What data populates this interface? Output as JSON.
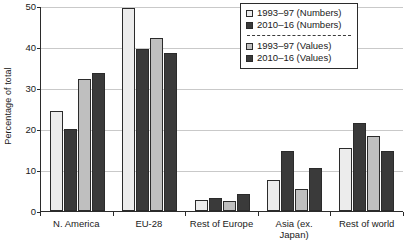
{
  "chart_data": {
    "type": "bar",
    "title": "",
    "subtitle": "",
    "xlabel": "",
    "ylabel": "Percentage of total",
    "ylim": [
      0,
      50
    ],
    "yticks": [
      0,
      10,
      20,
      30,
      40,
      50
    ],
    "ytick_labels": [
      "0",
      "10",
      "20",
      "30",
      "40",
      "50"
    ],
    "grid": true,
    "legend_position": "top-right",
    "legend_separator": "dashed",
    "categories": [
      "N. America",
      "EU-28",
      "Rest of Europe",
      "Asia (ex. Japan)",
      "Rest of world"
    ],
    "category_lines": [
      [
        "N. America"
      ],
      [
        "EU-28"
      ],
      [
        "Rest of Europe"
      ],
      [
        "Asia (ex.",
        "Japan)"
      ],
      [
        "Rest of world"
      ]
    ],
    "series": [
      {
        "name": "1993–97 (Numbers)",
        "color": "#ececec",
        "values": [
          24.5,
          49.5,
          2.8,
          7.6,
          15.4
        ]
      },
      {
        "name": "2010–16 (Numbers)",
        "color": "#3a3a3a",
        "values": [
          20.0,
          39.5,
          3.1,
          14.6,
          21.4
        ]
      },
      {
        "name": "1993–97 (Values)",
        "color": "#bfbfbf",
        "values": [
          32.3,
          42.1,
          2.4,
          5.3,
          18.2
        ]
      },
      {
        "name": "2010–16 (Values)",
        "color": "#3a3a3a",
        "values": [
          33.6,
          38.6,
          4.1,
          10.4,
          14.6
        ]
      }
    ]
  },
  "legend": {
    "entries": [
      {
        "label": "1993–97 (Numbers)",
        "swatch": "light-swatch-icon"
      },
      {
        "label": "2010–16 (Numbers)",
        "swatch": "dark-swatch-icon"
      },
      {
        "label": "1993–97 (Values)",
        "swatch": "medium-swatch-icon"
      },
      {
        "label": "2010–16 (Values)",
        "swatch": "dark-swatch-icon"
      }
    ]
  },
  "colors": {
    "series_1993_numbers": "#ececec",
    "series_2010_numbers": "#3a3a3a",
    "series_1993_values": "#bfbfbf",
    "series_2010_values": "#3a3a3a",
    "axis": "#2b2b2b",
    "gridline": "#c9c9c9",
    "background": "#ffffff"
  }
}
